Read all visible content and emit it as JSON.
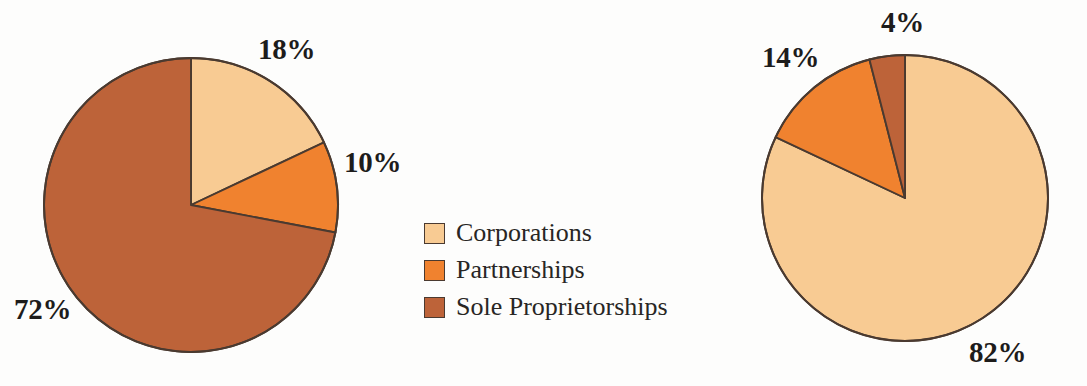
{
  "figure": {
    "background_color": "#fdfdfc",
    "label_text_color": "#1d1c1b",
    "slice_outline_color": "#4a3a30"
  },
  "palette": {
    "corporations": "#F8CB93",
    "partnerships": "#F0822F",
    "sole_proprietorships": "#BD6339"
  },
  "legend": {
    "items": [
      {
        "label": "Corporations",
        "color": "#F8CB93",
        "swatch_name": "legend-swatch-corporations"
      },
      {
        "label": "Partnerships",
        "color": "#F0822F",
        "swatch_name": "legend-swatch-partnerships"
      },
      {
        "label": "Sole Proprietorships",
        "color": "#BD6339",
        "swatch_name": "legend-swatch-sole-proprietorships"
      }
    ]
  },
  "chart_data": [
    {
      "type": "pie",
      "name": "number-of-businesses",
      "title": "",
      "categories": [
        "Corporations",
        "Partnerships",
        "Sole Proprietorships"
      ],
      "values": [
        18,
        10,
        72
      ],
      "unit": "%",
      "colors": [
        "#F8CB93",
        "#F0822F",
        "#BD6339"
      ],
      "start_angle_deg": 0,
      "direction": "clockwise",
      "center": {
        "x": 191,
        "y": 205
      },
      "radius": 147,
      "labels": [
        {
          "text": "18%",
          "x": 258,
          "y": 35
        },
        {
          "text": "10%",
          "x": 344,
          "y": 148
        },
        {
          "text": "72%",
          "x": 14,
          "y": 295
        }
      ]
    },
    {
      "type": "pie",
      "name": "business-receipts",
      "title": "",
      "categories": [
        "Corporations",
        "Partnerships",
        "Sole Proprietorships"
      ],
      "values": [
        82,
        14,
        4
      ],
      "unit": "%",
      "colors": [
        "#F8CB93",
        "#F0822F",
        "#BD6339"
      ],
      "start_angle_deg": 0,
      "direction": "clockwise",
      "center": {
        "x": 905,
        "y": 198
      },
      "radius": 143,
      "labels": [
        {
          "text": "82%",
          "x": 969,
          "y": 338
        },
        {
          "text": "14%",
          "x": 762,
          "y": 43
        },
        {
          "text": "4%",
          "x": 881,
          "y": 8
        }
      ]
    }
  ]
}
